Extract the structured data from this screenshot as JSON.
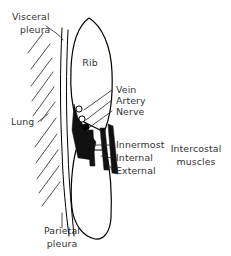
{
  "figure": {
    "background_color": "#ffffff",
    "line_color": "#000000",
    "text_color": "#333333",
    "muscle_fill_color": "#111111"
  },
  "labels": {
    "visceral_pleura_line1": "Visceral",
    "visceral_pleura_line2": "pleura",
    "rib": "Rib",
    "lung": "Lung",
    "vein": "Vein",
    "artery": "Artery",
    "nerve": "Nerve",
    "innermost": "Innermost",
    "internal": "Internal",
    "external": "External",
    "intercostal_line1": "Intercostal",
    "intercostal_line2": "muscles",
    "parietal_pleura_line1": "Parietal",
    "parietal_pleura_line2": "pleura"
  }
}
